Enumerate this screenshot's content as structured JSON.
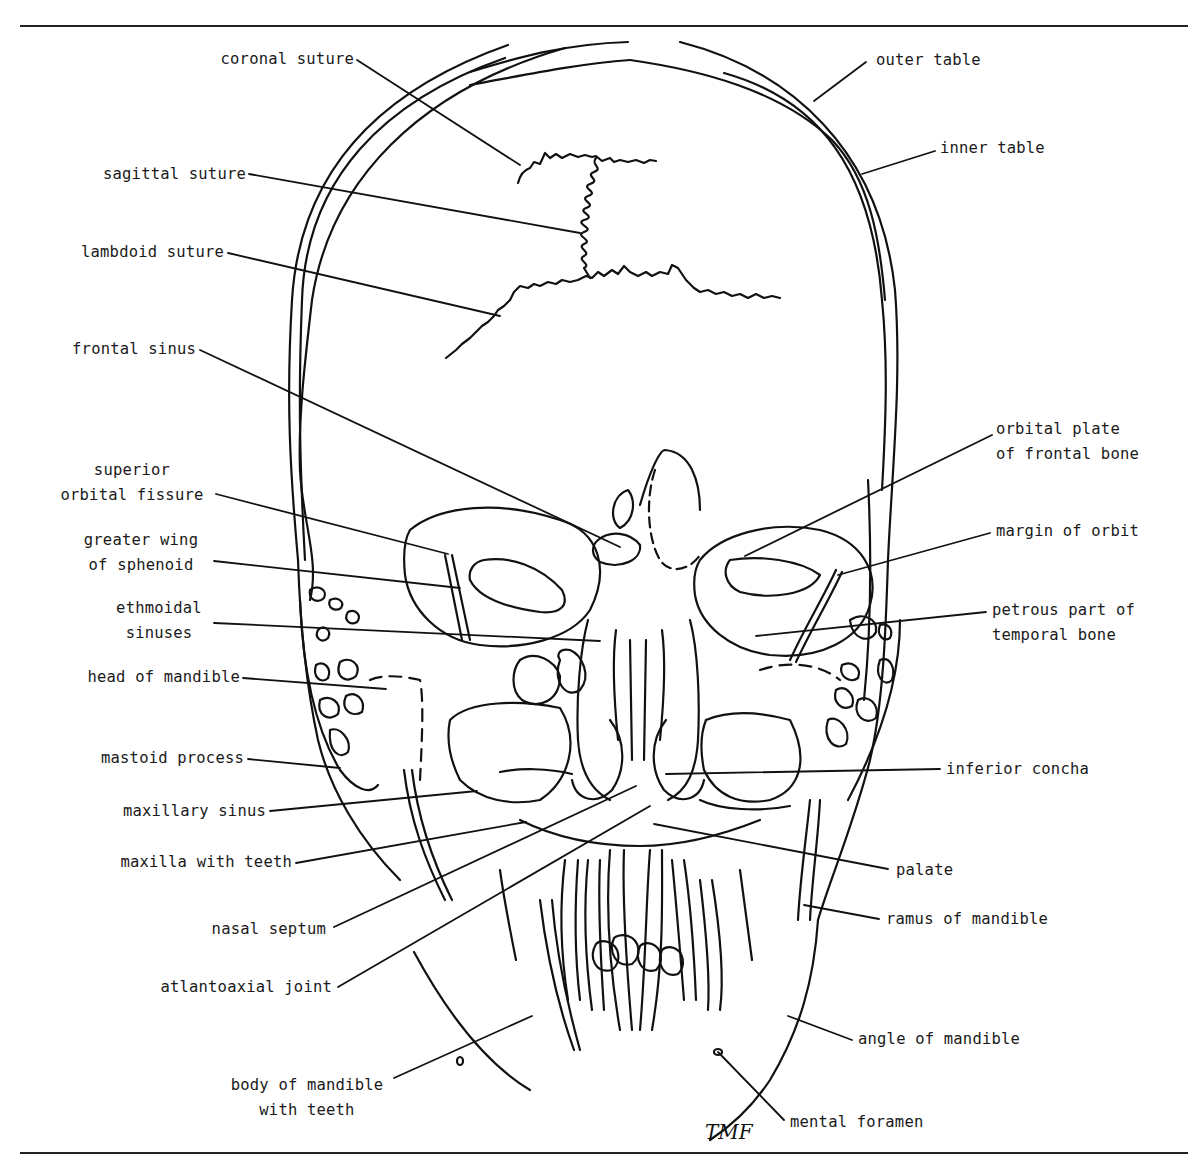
{
  "diagram": {
    "line_color": "#111111",
    "background": "#ffffff",
    "signature": "TMF",
    "labels_left": [
      {
        "id": "coronal-suture",
        "lines": [
          "coronal suture"
        ],
        "x": 208,
        "y": 47,
        "w": 146,
        "align": "right",
        "leader": [
          [
            357,
            60
          ],
          [
            520,
            165
          ]
        ]
      },
      {
        "id": "sagittal-suture",
        "lines": [
          "sagittal suture"
        ],
        "x": 88,
        "y": 162,
        "w": 158,
        "align": "right",
        "leader": [
          [
            249,
            174
          ],
          [
            580,
            233
          ]
        ]
      },
      {
        "id": "lambdoid-suture",
        "lines": [
          "lambdoid suture"
        ],
        "x": 66,
        "y": 240,
        "w": 158,
        "align": "right",
        "leader": [
          [
            228,
            253
          ],
          [
            500,
            316
          ]
        ]
      },
      {
        "id": "frontal-sinus",
        "lines": [
          "frontal sinus"
        ],
        "x": 60,
        "y": 337,
        "w": 136,
        "align": "right",
        "leader": [
          [
            200,
            350
          ],
          [
            620,
            547
          ]
        ]
      },
      {
        "id": "superior-orbital-fissure",
        "lines": [
          "superior",
          "orbital fissure"
        ],
        "x": 50,
        "y": 458,
        "w": 164,
        "align": "center",
        "leader": [
          [
            216,
            494
          ],
          [
            448,
            554
          ]
        ]
      },
      {
        "id": "greater-wing-of-sphenoid",
        "lines": [
          "greater wing",
          "of sphenoid"
        ],
        "x": 70,
        "y": 528,
        "w": 142,
        "align": "center",
        "leader": [
          [
            214,
            561
          ],
          [
            460,
            588
          ]
        ]
      },
      {
        "id": "ethmoidal-sinuses",
        "lines": [
          "ethmoidal",
          "sinuses"
        ],
        "x": 110,
        "y": 596,
        "w": 98,
        "align": "center",
        "leader": [
          [
            214,
            623
          ],
          [
            600,
            641
          ]
        ]
      },
      {
        "id": "head-of-mandible",
        "lines": [
          "head of mandible"
        ],
        "x": 70,
        "y": 665,
        "w": 170,
        "align": "right",
        "leader": [
          [
            243,
            678
          ],
          [
            386,
            689
          ]
        ]
      },
      {
        "id": "mastoid-process",
        "lines": [
          "mastoid process"
        ],
        "x": 80,
        "y": 746,
        "w": 164,
        "align": "right",
        "leader": [
          [
            248,
            759
          ],
          [
            340,
            768
          ]
        ]
      },
      {
        "id": "maxillary-sinus",
        "lines": [
          "maxillary sinus"
        ],
        "x": 98,
        "y": 799,
        "w": 168,
        "align": "right",
        "leader": [
          [
            270,
            811
          ],
          [
            477,
            791
          ]
        ]
      },
      {
        "id": "maxilla-with-teeth",
        "lines": [
          "maxilla with teeth"
        ],
        "x": 90,
        "y": 850,
        "w": 202,
        "align": "right",
        "leader": [
          [
            296,
            863
          ],
          [
            526,
            822
          ]
        ]
      },
      {
        "id": "nasal-septum",
        "lines": [
          "nasal septum"
        ],
        "x": 196,
        "y": 917,
        "w": 130,
        "align": "right",
        "leader": [
          [
            334,
            927
          ],
          [
            636,
            786
          ]
        ]
      },
      {
        "id": "atlantoaxial-joint",
        "lines": [
          "atlantoaxial joint"
        ],
        "x": 140,
        "y": 975,
        "w": 192,
        "align": "right",
        "leader": [
          [
            338,
            987
          ],
          [
            650,
            806
          ]
        ]
      },
      {
        "id": "body-of-mandible-with-teeth",
        "lines": [
          "body of mandible",
          "with teeth"
        ],
        "x": 222,
        "y": 1073,
        "w": 170,
        "align": "center",
        "leader": [
          [
            394,
            1078
          ],
          [
            532,
            1016
          ]
        ]
      }
    ],
    "labels_right": [
      {
        "id": "outer-table",
        "lines": [
          "outer table"
        ],
        "x": 876,
        "y": 48,
        "w": 120,
        "align": "left",
        "leader": [
          [
            866,
            62
          ],
          [
            814,
            101
          ]
        ]
      },
      {
        "id": "inner-table",
        "lines": [
          "inner table"
        ],
        "x": 940,
        "y": 136,
        "w": 130,
        "align": "left",
        "leader": [
          [
            935,
            151
          ],
          [
            862,
            174
          ]
        ]
      },
      {
        "id": "orbital-plate-of-frontal-bone",
        "lines": [
          "orbital plate",
          "of frontal bone"
        ],
        "x": 996,
        "y": 417,
        "w": 168,
        "align": "left",
        "leader": [
          [
            992,
            435
          ],
          [
            745,
            556
          ]
        ]
      },
      {
        "id": "margin-of-orbit",
        "lines": [
          "margin of orbit"
        ],
        "x": 996,
        "y": 519,
        "w": 156,
        "align": "left",
        "leader": [
          [
            990,
            533
          ],
          [
            838,
            575
          ]
        ]
      },
      {
        "id": "petrous-part-of-temporal-bone",
        "lines": [
          "petrous part of",
          "temporal bone"
        ],
        "x": 992,
        "y": 598,
        "w": 166,
        "align": "left",
        "leader": [
          [
            986,
            612
          ],
          [
            756,
            636
          ]
        ]
      },
      {
        "id": "inferior-concha",
        "lines": [
          "inferior concha"
        ],
        "x": 946,
        "y": 757,
        "w": 160,
        "align": "left",
        "leader": [
          [
            940,
            769
          ],
          [
            666,
            774
          ]
        ]
      },
      {
        "id": "palate",
        "lines": [
          "palate"
        ],
        "x": 896,
        "y": 858,
        "w": 80,
        "align": "left",
        "leader": [
          [
            888,
            869
          ],
          [
            654,
            824
          ]
        ]
      },
      {
        "id": "ramus-of-mandible",
        "lines": [
          "ramus of mandible"
        ],
        "x": 886,
        "y": 907,
        "w": 190,
        "align": "left",
        "leader": [
          [
            879,
            919
          ],
          [
            804,
            905
          ]
        ]
      },
      {
        "id": "angle-of-mandible",
        "lines": [
          "angle of mandible"
        ],
        "x": 858,
        "y": 1027,
        "w": 190,
        "align": "left",
        "leader": [
          [
            852,
            1040
          ],
          [
            788,
            1016
          ]
        ]
      },
      {
        "id": "mental-foramen",
        "lines": [
          "mental foramen"
        ],
        "x": 790,
        "y": 1110,
        "w": 176,
        "align": "left",
        "leader": [
          [
            784,
            1120
          ],
          [
            718,
            1052
          ]
        ]
      }
    ],
    "rules": [
      {
        "y": 25
      },
      {
        "y": 1152
      }
    ]
  }
}
